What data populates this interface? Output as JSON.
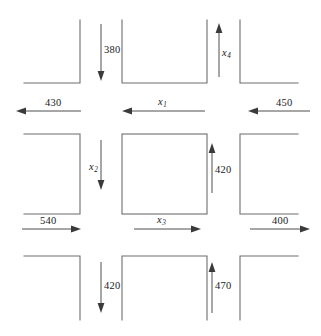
{
  "figure": {
    "type": "traffic-flow-network-diagram",
    "line_color": "#6d6d6d",
    "arrow_color": "#3a3a3a",
    "background": "#ffffff"
  },
  "flows": {
    "top_row_horizontal": [
      {
        "id": "flow-430",
        "label": "430",
        "direction": "left",
        "kind": "number"
      },
      {
        "id": "flow-x1",
        "label": "x",
        "sub": "1",
        "direction": "left",
        "kind": "variable"
      },
      {
        "id": "flow-450",
        "label": "450",
        "direction": "left",
        "kind": "number"
      }
    ],
    "bottom_row_horizontal": [
      {
        "id": "flow-540",
        "label": "540",
        "direction": "right",
        "kind": "number"
      },
      {
        "id": "flow-x3",
        "label": "x",
        "sub": "3",
        "direction": "right",
        "kind": "variable"
      },
      {
        "id": "flow-400",
        "label": "400",
        "direction": "right",
        "kind": "number"
      }
    ],
    "top_vertical": [
      {
        "id": "flow-380",
        "label": "380",
        "direction": "down",
        "kind": "number"
      },
      {
        "id": "flow-x4",
        "label": "x",
        "sub": "4",
        "direction": "up",
        "kind": "variable"
      }
    ],
    "middle_vertical": [
      {
        "id": "flow-x2",
        "label": "x",
        "sub": "2",
        "direction": "down",
        "kind": "variable"
      },
      {
        "id": "flow-420r",
        "label": "420",
        "direction": "up",
        "kind": "number"
      }
    ],
    "bottom_vertical": [
      {
        "id": "flow-420b",
        "label": "420",
        "direction": "down",
        "kind": "number"
      },
      {
        "id": "flow-470",
        "label": "470",
        "direction": "up",
        "kind": "number"
      }
    ]
  },
  "labels": {
    "n430": "430",
    "n450": "450",
    "n540": "540",
    "n400": "400",
    "n380": "380",
    "n420_right": "420",
    "n420_bottom": "420",
    "n470": "470",
    "x1": "x",
    "x1_sub": "1",
    "x2": "x",
    "x2_sub": "2",
    "x3": "x",
    "x3_sub": "3",
    "x4": "x",
    "x4_sub": "4"
  }
}
